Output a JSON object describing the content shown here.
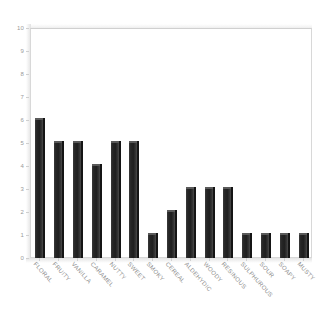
{
  "chart_data": {
    "type": "bar",
    "title": "",
    "subtitle": "",
    "xlabel": "",
    "ylabel": "",
    "ylim": [
      0,
      10
    ],
    "ytick_step": 1,
    "yticks": [
      0,
      1,
      2,
      3,
      4,
      5,
      6,
      7,
      8,
      9,
      10
    ],
    "grid": false,
    "legend": false,
    "legend_position": "none",
    "categories": [
      "FLORAL",
      "FRUITY",
      "VANILLA",
      "CARAMEL",
      "NUTTY",
      "SWEET",
      "SMOKY",
      "CEREAL",
      "ALDEHYDIC",
      "WOODY",
      "RESINOUS",
      "SULPHUROUS",
      "SOUR",
      "SOAPY",
      "MUSTY"
    ],
    "values": [
      6,
      5,
      5,
      4,
      5,
      5,
      1,
      2,
      3,
      3,
      3,
      1,
      1,
      1,
      1
    ],
    "bar_color": "#262626",
    "axis_color": "#d8d8d8",
    "tick_label_color": "#9a9a9a",
    "category_label_color": "#8e8e8e",
    "background_color": "#ffffff",
    "category_label_rotation": 48
  }
}
